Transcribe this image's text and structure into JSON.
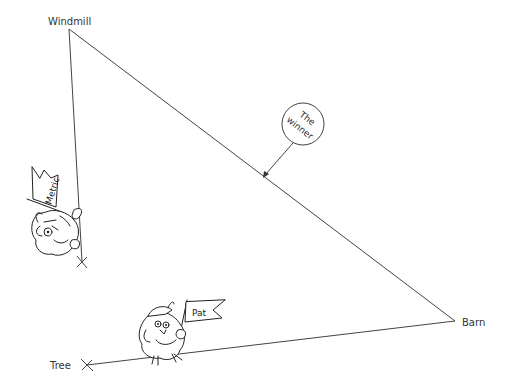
{
  "diagram": {
    "points": {
      "windmill": {
        "label": "Windmill",
        "x": 69,
        "y": 29
      },
      "barn": {
        "label": "Barn",
        "x": 455,
        "y": 321
      },
      "tree": {
        "label": "Tree",
        "x": 87,
        "y": 365
      },
      "metric_end": {
        "x": 82,
        "y": 262
      }
    },
    "callout": {
      "line1": "The",
      "line2": "winner"
    },
    "characters": {
      "metric": {
        "flag_text": "Metric"
      },
      "pat": {
        "flag_text": "Pat"
      }
    },
    "colors": {
      "line": "#444444",
      "text": "#333333",
      "background": "#ffffff"
    }
  }
}
